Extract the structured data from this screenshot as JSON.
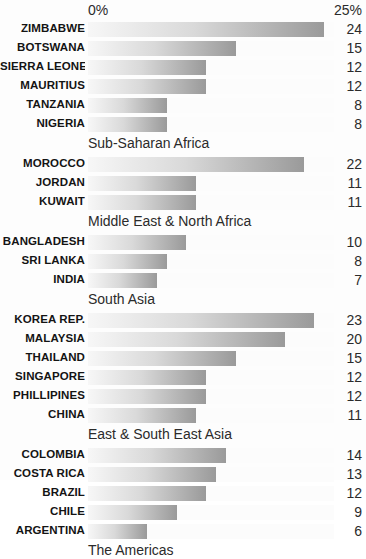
{
  "axis": {
    "left_label": "0%",
    "right_label": "25%",
    "max_value": 25,
    "min_value": 0
  },
  "title_fragment": "",
  "chart_data": {
    "type": "bar",
    "orientation": "horizontal",
    "title": "",
    "xlabel": "",
    "ylabel": "",
    "xlim": [
      0,
      25
    ],
    "grid": false,
    "legend": "none",
    "axis_tick_labels": [
      "0%",
      "25%"
    ],
    "value_suffix": "%",
    "groups": [
      {
        "name": "Sub-Saharan Africa",
        "categories": [
          "ZIMBABWE",
          "BOTSWANA",
          "SIERRA LEONE",
          "MAURITIUS",
          "TANZANIA",
          "NIGERIA"
        ],
        "values": [
          24,
          15,
          12,
          12,
          8,
          8
        ]
      },
      {
        "name": "Middle East & North Africa",
        "categories": [
          "MOROCCO",
          "JORDAN",
          "KUWAIT"
        ],
        "values": [
          22,
          11,
          11
        ]
      },
      {
        "name": "South Asia",
        "categories": [
          "BANGLADESH",
          "SRI LANKA",
          "INDIA"
        ],
        "values": [
          10,
          8,
          7
        ]
      },
      {
        "name": "East & South East Asia",
        "categories": [
          "KOREA REP.",
          "MALAYSIA",
          "THAILAND",
          "SINGAPORE",
          "PHILLIPINES",
          "CHINA"
        ],
        "values": [
          23,
          20,
          15,
          12,
          12,
          11
        ]
      },
      {
        "name": "The Americas",
        "categories": [
          "COLOMBIA",
          "COSTA RICA",
          "BRAZIL",
          "CHILE",
          "ARGENTINA"
        ],
        "values": [
          14,
          13,
          12,
          9,
          6
        ]
      }
    ],
    "categories": [
      "ZIMBABWE",
      "BOTSWANA",
      "SIERRA LEONE",
      "MAURITIUS",
      "TANZANIA",
      "NIGERIA",
      "MOROCCO",
      "JORDAN",
      "KUWAIT",
      "BANGLADESH",
      "SRI LANKA",
      "INDIA",
      "KOREA REP.",
      "MALAYSIA",
      "THAILAND",
      "SINGAPORE",
      "PHILLIPINES",
      "CHINA",
      "COLOMBIA",
      "COSTA RICA",
      "BRAZIL",
      "CHILE",
      "ARGENTINA"
    ],
    "values": [
      24,
      15,
      12,
      12,
      8,
      8,
      22,
      11,
      11,
      10,
      8,
      7,
      23,
      20,
      15,
      12,
      12,
      11,
      14,
      13,
      12,
      9,
      6
    ]
  },
  "colors": {
    "bar_gradient_start": "#f7f7f7",
    "bar_gradient_end": "#9a9a9a",
    "background": "#fdfdfd",
    "text": "#1a1a1a"
  }
}
